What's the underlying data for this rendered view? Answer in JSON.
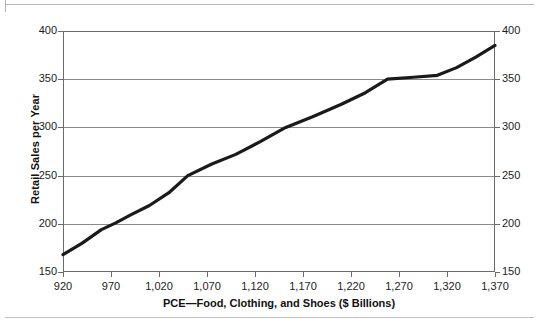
{
  "chart_data": {
    "type": "line",
    "title": "",
    "xlabel": "PCE—Food, Clothing, and Shoes ($ Billions)",
    "ylabel": "Retail Sales per Year",
    "xlim": [
      920,
      1370
    ],
    "ylim": [
      150,
      400
    ],
    "grid": true,
    "legend": "none",
    "x_tick_labels": [
      "920",
      "970",
      "1,020",
      "1,070",
      "1,120",
      "1,170",
      "1,220",
      "1,270",
      "1,320",
      "1,370"
    ],
    "x_ticks": [
      920,
      970,
      1020,
      1070,
      1120,
      1170,
      1220,
      1270,
      1320,
      1370
    ],
    "y_tick_labels_left": [
      "400",
      "350",
      "300",
      "250",
      "200",
      "150"
    ],
    "y_tick_labels_right": [
      "400",
      "350",
      "300",
      "250",
      "200",
      "150"
    ],
    "y_ticks": [
      400,
      350,
      300,
      250,
      200,
      150
    ],
    "series": [
      {
        "name": "Retail Sales per Year",
        "color": "#1a1a1a",
        "x": [
          920,
          940,
          960,
          975,
          990,
          1010,
          1030,
          1050,
          1075,
          1100,
          1125,
          1152,
          1180,
          1210,
          1235,
          1258,
          1285,
          1310,
          1330,
          1350,
          1370
        ],
        "y": [
          168,
          180,
          194,
          201,
          209,
          219,
          232,
          250,
          262,
          272,
          285,
          300,
          311,
          324,
          336,
          350,
          352,
          354,
          362,
          373,
          385
        ]
      }
    ]
  },
  "axis": {
    "y_label": "Retail Sales per Year",
    "x_label": "PCE—Food, Clothing, and Shoes ($ Billions)"
  }
}
